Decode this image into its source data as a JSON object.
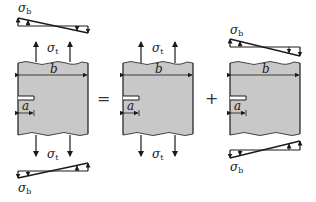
{
  "diagram": {
    "title": "",
    "operators": {
      "equals": "=",
      "plus": "+"
    },
    "labels": {
      "width_symbol": "b",
      "crack_symbol": "a",
      "tension_stress": "σ",
      "tension_sub": "t",
      "bending_stress": "σ",
      "bending_sub": "b"
    },
    "panels": [
      {
        "id": "combined",
        "loads": [
          "bending",
          "tension"
        ]
      },
      {
        "id": "tension-only",
        "loads": [
          "tension"
        ]
      },
      {
        "id": "bending-only",
        "loads": [
          "bending"
        ]
      }
    ],
    "colors": {
      "plate_fill": "#c8c8c8",
      "stroke": "#1a1a1a",
      "background": "#ffffff"
    }
  }
}
